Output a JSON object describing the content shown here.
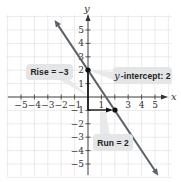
{
  "chart_data": {
    "type": "line",
    "title": "",
    "xlabel": "x",
    "ylabel": "y",
    "xlim": [
      -5.5,
      5.5
    ],
    "ylim": [
      -5.5,
      5.5
    ],
    "grid": true,
    "x_ticks": [
      "−5",
      "−4",
      "−3",
      "−2",
      "−1",
      "1",
      "3",
      "4",
      "5"
    ],
    "y_ticks": [
      "5",
      "4",
      "3",
      "2",
      "1",
      "−1",
      "−2",
      "−3",
      "−4",
      "−5"
    ],
    "series": [
      {
        "name": "y = -3/2 x + 2",
        "slope": -1.5,
        "intercept": 2,
        "x": [
          -2.5,
          5.25
        ],
        "y": [
          5.75,
          -5.875
        ],
        "color": "#5c6168"
      }
    ],
    "points": [
      {
        "x": 0,
        "y": 2,
        "label": "y-intercept"
      },
      {
        "x": 2,
        "y": -1
      }
    ],
    "annotations": [
      {
        "text": "Rise = −3",
        "from": [
          0,
          2
        ],
        "to": [
          0,
          -1
        ]
      },
      {
        "text": "y-intercept: 2",
        "at": [
          0,
          2
        ]
      },
      {
        "text": "Run = 2",
        "from": [
          0,
          -1
        ],
        "to": [
          2,
          -1
        ]
      }
    ]
  },
  "labels": {
    "x_axis": "x",
    "y_axis": "y",
    "rise_prefix": "Rise = ",
    "rise_value": "−3",
    "intercept_var": "y",
    "intercept_text": "-intercept: 2",
    "run_prefix": "Run = ",
    "run_value": "2"
  },
  "colors": {
    "line": "#5c6168",
    "grid": "#e2e2e2",
    "axis": "#333333",
    "callout_bg": "#e4e5e6",
    "point": "#111111"
  }
}
